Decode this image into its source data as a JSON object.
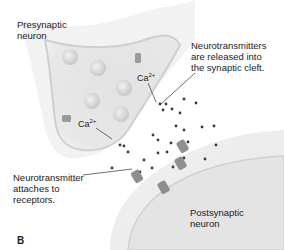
{
  "panel_letter": "B",
  "labels": {
    "presynaptic": "Presynaptic\nneuron",
    "released": "Neurotransmitters\nare released into\nthe synaptic cleft.",
    "attaches": "Neurotransmitter\nattaches to\nreceptors.",
    "postsynaptic": "Postsynaptic\nneuron",
    "calcium_1": "Ca",
    "calcium_1_charge": "2+",
    "calcium_2": "Ca",
    "calcium_2_charge": "2+"
  },
  "colors": {
    "membrane_fill": "#e6e6e6",
    "membrane_edge": "#c9c9c9",
    "inner_fill": "#dedede",
    "vesicle": "#d2d2d2",
    "neurotransmitter": "#3a3a3a",
    "channel": "#9a9a9a",
    "leader_line": "#333333"
  }
}
